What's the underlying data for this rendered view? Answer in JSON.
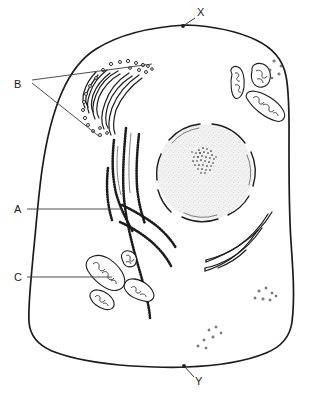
{
  "figure": {
    "caption": "",
    "background_color": "#ffffff",
    "line_color": "#1b1b1b",
    "stipple_color": "#555555",
    "nucleoplasm_color": "#f2f2f2",
    "width": 318,
    "height": 393
  },
  "labels": [
    {
      "id": "A",
      "text": "A",
      "refers_to": "rough-endoplasmic-reticulum",
      "x": 14,
      "y": 212,
      "leader": "single",
      "leader_end_x": 122,
      "leader_end_y": 209
    },
    {
      "id": "B",
      "text": "B",
      "refers_to": "golgi-apparatus-and-vesicles",
      "x": 17,
      "y": 84,
      "leader": "double",
      "leader_end_x": 118,
      "leader_end_y": 68
    },
    {
      "id": "C",
      "text": "C",
      "refers_to": "mitochondria",
      "x": 14,
      "y": 281,
      "leader": "single",
      "leader_end_x": 112,
      "leader_end_y": 277
    },
    {
      "id": "X",
      "text": "X",
      "refers_to": "cell-surface-membrane-upper",
      "x": 198,
      "y": 14,
      "leader": "arrow",
      "leader_end_x": 186,
      "leader_end_y": 25
    },
    {
      "id": "Y",
      "text": "Y",
      "refers_to": "cell-surface-membrane-lower",
      "x": 196,
      "y": 380,
      "leader": "arrow",
      "leader_end_x": 186,
      "leader_end_y": 367
    }
  ],
  "structures": [
    {
      "name": "cell-surface-membrane",
      "count": 1,
      "style": "single thick closed outline"
    },
    {
      "name": "nucleus",
      "count": 1,
      "style": "segmented double membrane with nuclear pores, stippled nucleoplasm"
    },
    {
      "name": "nucleolus",
      "count": 1,
      "style": "dense stipple cluster inside nucleus"
    },
    {
      "name": "rough-endoplasmic-reticulum",
      "count": 1,
      "style": "branching cisternae studded with ribosomes"
    },
    {
      "name": "smooth-endoplasmic-reticulum",
      "count": 1,
      "style": "smooth curved tubules, right of nucleus"
    },
    {
      "name": "golgi-apparatus",
      "count": 1,
      "style": "stack of flattened curved cisternae"
    },
    {
      "name": "golgi-vesicles",
      "count": 22,
      "style": "small open circles around golgi"
    },
    {
      "name": "mitochondria-lower-left",
      "count": 4,
      "style": "oval with internal cristae"
    },
    {
      "name": "mitochondria-upper-right",
      "count": 3,
      "style": "oval with internal cristae"
    },
    {
      "name": "free-ribosomes",
      "count": 3,
      "style": "scattered small dot clusters"
    }
  ]
}
